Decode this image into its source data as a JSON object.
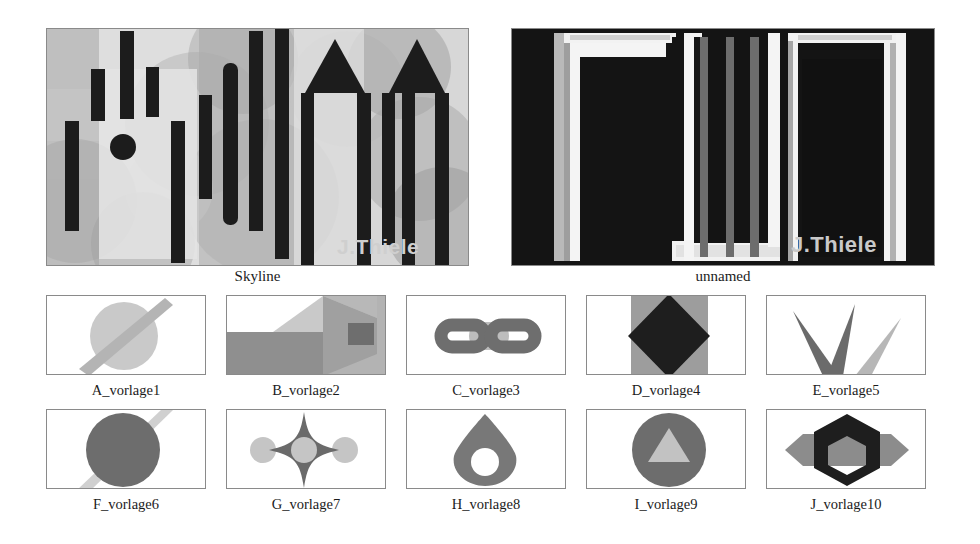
{
  "page": {
    "background": "#ffffff",
    "text_color": "#1b1b1b"
  },
  "signature": {
    "text": "J.Thiele",
    "color_on_skyline": "#cfcfcf",
    "color_on_unnamed": "#c9c9c9"
  },
  "hero": [
    {
      "id": "skyline",
      "caption": "Skyline",
      "palette": {
        "bg": "#d9d9d9",
        "light": "#e8e8e8",
        "mid_light": "#c6c6c6",
        "mid": "#a8a8a8",
        "mid_dark": "#8e8e8e",
        "dark": "#6f6f6f",
        "bar": "#1c1c1c"
      },
      "description": "Abstract skyline of black vertical bars, towers with triangular roofs and overlapping translucent grey circles"
    },
    {
      "id": "unnamed",
      "caption": "unnamed",
      "palette": {
        "bg": "#141414",
        "white": "#f4f4f4",
        "grey": "#9a9a9a",
        "mid": "#6d6d6d"
      },
      "description": "Two large black rectangles framed in white with grey vertical bars between them"
    }
  ],
  "thumbnails": [
    {
      "id": "a",
      "caption": "A_vorlage1",
      "shape": "circle-with-diagonal-stripe",
      "colors": {
        "primary": "#c9c9c9",
        "secondary": "#b4b4b4"
      }
    },
    {
      "id": "b",
      "caption": "B_vorlage2",
      "shape": "isometric-box-with-square",
      "colors": {
        "primary": "#b9b9b9",
        "secondary": "#8f8f8f",
        "accent": "#6e6e6e"
      }
    },
    {
      "id": "c",
      "caption": "C_vorlage3",
      "shape": "chain-link",
      "colors": {
        "primary": "#6e6e6e",
        "secondary": "#bdbdbd"
      }
    },
    {
      "id": "d",
      "caption": "D_vorlage4",
      "shape": "diamond-on-square",
      "colors": {
        "primary": "#1e1e1e",
        "secondary": "#9d9d9d"
      }
    },
    {
      "id": "e",
      "caption": "E_vorlage5",
      "shape": "three-spikes",
      "colors": {
        "primary": "#6b6b6b",
        "secondary": "#b7b7b7"
      }
    },
    {
      "id": "f",
      "caption": "F_vorlage6",
      "shape": "circle-with-faint-stripe",
      "colors": {
        "primary": "#6d6d6d",
        "secondary": "#d0d0d0"
      }
    },
    {
      "id": "g",
      "caption": "G_vorlage7",
      "shape": "four-point-star-with-circles",
      "colors": {
        "primary": "#6a6a6a",
        "secondary": "#c5c5c5"
      }
    },
    {
      "id": "h",
      "caption": "H_vorlage8",
      "shape": "teardrop-with-hole",
      "colors": {
        "primary": "#787878",
        "secondary": "#ffffff"
      }
    },
    {
      "id": "i",
      "caption": "I_vorlage9",
      "shape": "circle-with-triangle",
      "colors": {
        "primary": "#6d6d6d",
        "secondary": "#c2c2c2"
      }
    },
    {
      "id": "j",
      "caption": "J_vorlage10",
      "shape": "hexagon-ring-over-band",
      "colors": {
        "primary": "#1e1e1e",
        "secondary": "#8c8c8c"
      }
    }
  ]
}
